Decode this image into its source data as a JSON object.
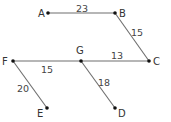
{
  "diagram": {
    "type": "weighted-graph",
    "colors": {
      "edge": "#6e6e6e",
      "node": "#111111",
      "text": "#333333"
    },
    "nodes": [
      {
        "id": "A",
        "label": "A",
        "x": 48,
        "y": 13,
        "lx": 38,
        "ly": 17
      },
      {
        "id": "B",
        "label": "B",
        "x": 115,
        "y": 13,
        "lx": 119,
        "ly": 17
      },
      {
        "id": "C",
        "label": "C",
        "x": 149,
        "y": 61,
        "lx": 153,
        "ly": 65
      },
      {
        "id": "F",
        "label": "F",
        "x": 13,
        "y": 61,
        "lx": 2,
        "ly": 65
      },
      {
        "id": "G",
        "label": "G",
        "x": 81,
        "y": 61,
        "lx": 76,
        "ly": 54
      },
      {
        "id": "E",
        "label": "E",
        "x": 47,
        "y": 108,
        "lx": 37,
        "ly": 117
      },
      {
        "id": "D",
        "label": "D",
        "x": 115,
        "y": 108,
        "lx": 118,
        "ly": 117
      }
    ],
    "edges": [
      {
        "from": "A",
        "to": "B",
        "weight": "23",
        "lx": 76,
        "ly": 12
      },
      {
        "from": "B",
        "to": "C",
        "weight": "15",
        "lx": 131,
        "ly": 36
      },
      {
        "from": "G",
        "to": "C",
        "weight": "13",
        "lx": 111,
        "ly": 59
      },
      {
        "from": "F",
        "to": "G",
        "weight": "15",
        "lx": 41,
        "ly": 73
      },
      {
        "from": "F",
        "to": "E",
        "weight": "20",
        "lx": 17,
        "ly": 92
      },
      {
        "from": "G",
        "to": "D",
        "weight": "18",
        "lx": 98,
        "ly": 86
      }
    ]
  }
}
